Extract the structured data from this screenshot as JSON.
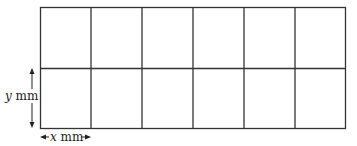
{
  "diagram": {
    "grid": {
      "rows": 2,
      "columns": 6,
      "line_color": "#333333"
    },
    "labels": {
      "height_var": "y",
      "height_unit": " mm",
      "width_var": "x",
      "width_unit": " mm"
    }
  }
}
